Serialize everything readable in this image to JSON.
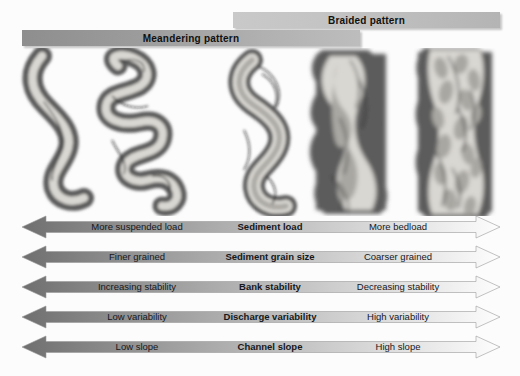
{
  "diagram": {
    "pattern_bars": [
      {
        "id": "braided",
        "label": "Braided pattern"
      },
      {
        "id": "meandering",
        "label": "Meandering pattern"
      }
    ],
    "channel_planforms": [
      {
        "id": "planform-1",
        "type": "meandering",
        "sinuosity": "high",
        "bars": 0
      },
      {
        "id": "planform-2",
        "type": "meandering",
        "sinuosity": "very high",
        "bars": 0
      },
      {
        "id": "planform-3",
        "type": "meandering-wide",
        "sinuosity": "high",
        "bars": 1
      },
      {
        "id": "planform-4",
        "type": "low-braided",
        "sinuosity": "low",
        "bars": 2
      },
      {
        "id": "planform-5",
        "type": "braided",
        "sinuosity": "low",
        "bars": 12
      }
    ],
    "parameters": [
      {
        "left": "More suspended load",
        "center": "Sediment load",
        "right": "More bedload"
      },
      {
        "left": "Finer grained",
        "center": "Sediment grain size",
        "right": "Coarser grained"
      },
      {
        "left": "Increasing stability",
        "center": "Bank stability",
        "right": "Decreasing stability"
      },
      {
        "left": "Low variability",
        "center": "Discharge variability",
        "right": "High variability"
      },
      {
        "left": "Low slope",
        "center": "Channel slope",
        "right": "High slope"
      }
    ],
    "colors": {
      "arrow_dark": "#6f6f6f",
      "arrow_light": "#ffffff",
      "bar_braided": "#c2c2c2",
      "bar_meandering": "#9c9c9c",
      "floodplain": "#5b5b5b",
      "water": "#d7d5d0",
      "bar_sediment": "#a9a7a2",
      "background": "#fcfcfc"
    }
  }
}
